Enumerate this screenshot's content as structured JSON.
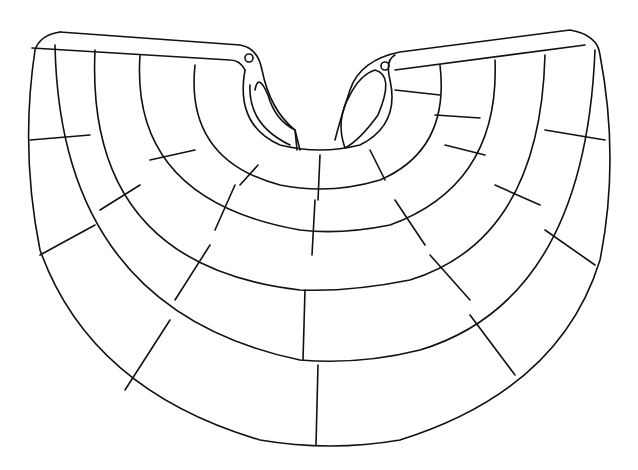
{
  "figure": {
    "stroke_color": "#111111",
    "background_color": "#ffffff",
    "rows": 4
  }
}
